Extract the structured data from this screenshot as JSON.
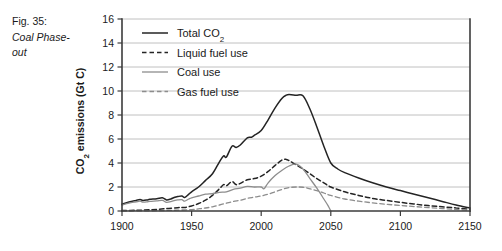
{
  "caption": {
    "label": "Fig. 35:",
    "title": "Coal Phase-out"
  },
  "chart_data": {
    "type": "line",
    "title": "",
    "xlabel": "",
    "ylabel": "CO2 emissions (Gt C)",
    "ylabel_display": "CO₂ emissions (Gt C)",
    "xlim": [
      1900,
      2150
    ],
    "ylim": [
      0,
      16
    ],
    "xticks": [
      1900,
      1950,
      2000,
      2050,
      2100,
      2150
    ],
    "xticklabels": [
      "1900",
      "1950",
      "2000",
      "2050",
      "2100",
      "2150"
    ],
    "yticks": [
      0,
      2,
      4,
      6,
      8,
      10,
      12,
      14,
      16
    ],
    "yticklabels": [
      "0",
      "2",
      "4",
      "6",
      "8",
      "10",
      "12",
      "14",
      "16"
    ],
    "grid": "horizontal",
    "legend_position": "top-left-inside",
    "series": [
      {
        "name": "Total CO2",
        "name_display": "Total CO₂",
        "color": "#242424",
        "dash": "solid",
        "width": 1.5,
        "x": [
          1900,
          1905,
          1910,
          1913,
          1915,
          1918,
          1920,
          1925,
          1929,
          1932,
          1935,
          1938,
          1940,
          1943,
          1945,
          1948,
          1950,
          1955,
          1960,
          1965,
          1970,
          1973,
          1975,
          1979,
          1982,
          1985,
          1990,
          1993,
          1995,
          2000,
          2005,
          2010,
          2015,
          2018,
          2020,
          2025,
          2030,
          2035,
          2040,
          2045,
          2050,
          2055,
          2060,
          2070,
          2080,
          2090,
          2100,
          2110,
          2120,
          2130,
          2140,
          2150
        ],
        "values": [
          0.56,
          0.75,
          0.88,
          0.95,
          0.88,
          0.92,
          0.97,
          1.02,
          1.1,
          0.92,
          1.0,
          1.15,
          1.2,
          1.25,
          1.12,
          1.4,
          1.6,
          2.0,
          2.55,
          3.1,
          4.1,
          4.6,
          4.5,
          5.4,
          5.3,
          5.5,
          6.1,
          6.15,
          6.3,
          6.7,
          7.6,
          8.6,
          9.4,
          9.65,
          9.7,
          9.65,
          9.6,
          8.5,
          7.0,
          5.4,
          4.0,
          3.5,
          3.2,
          2.75,
          2.35,
          2.0,
          1.7,
          1.4,
          1.1,
          0.8,
          0.5,
          0.25
        ]
      },
      {
        "name": "Liquid fuel use",
        "color": "#242424",
        "dash": "dashed",
        "width": 1.5,
        "x": [
          1900,
          1910,
          1920,
          1930,
          1940,
          1945,
          1950,
          1955,
          1960,
          1965,
          1970,
          1973,
          1975,
          1979,
          1982,
          1985,
          1990,
          1995,
          2000,
          2005,
          2010,
          2015,
          2018,
          2020,
          2025,
          2030,
          2035,
          2040,
          2045,
          2050,
          2060,
          2070,
          2080,
          2090,
          2100,
          2110,
          2120,
          2130,
          2140,
          2150
        ],
        "values": [
          0.04,
          0.06,
          0.1,
          0.18,
          0.28,
          0.3,
          0.42,
          0.62,
          0.9,
          1.3,
          1.85,
          2.2,
          2.1,
          2.45,
          2.2,
          2.3,
          2.6,
          2.7,
          2.9,
          3.3,
          3.8,
          4.25,
          4.3,
          4.2,
          3.85,
          3.5,
          3.1,
          2.7,
          2.35,
          2.0,
          1.6,
          1.3,
          1.05,
          0.88,
          0.72,
          0.58,
          0.45,
          0.35,
          0.25,
          0.15
        ]
      },
      {
        "name": "Coal use",
        "color": "#8d8d8d",
        "dash": "solid",
        "width": 1.3,
        "x": [
          1900,
          1905,
          1910,
          1913,
          1915,
          1918,
          1920,
          1925,
          1929,
          1932,
          1935,
          1938,
          1940,
          1943,
          1945,
          1948,
          1950,
          1955,
          1960,
          1965,
          1970,
          1975,
          1980,
          1985,
          1990,
          1995,
          2000,
          2002,
          2005,
          2010,
          2015,
          2020,
          2025,
          2030,
          2035,
          2040,
          2045,
          2048,
          2050
        ],
        "values": [
          0.5,
          0.66,
          0.76,
          0.82,
          0.74,
          0.76,
          0.8,
          0.84,
          0.88,
          0.72,
          0.78,
          0.88,
          0.92,
          0.95,
          0.82,
          1.0,
          1.1,
          1.25,
          1.4,
          1.45,
          1.55,
          1.6,
          1.8,
          1.9,
          2.05,
          2.0,
          2.0,
          1.85,
          2.35,
          2.95,
          3.4,
          3.75,
          3.9,
          3.5,
          2.7,
          1.9,
          1.0,
          0.45,
          0.0
        ]
      },
      {
        "name": "Gas fuel use",
        "color": "#8d8d8d",
        "dash": "dashed",
        "width": 1.3,
        "x": [
          1900,
          1920,
          1930,
          1940,
          1950,
          1955,
          1960,
          1965,
          1970,
          1975,
          1980,
          1985,
          1990,
          1995,
          2000,
          2005,
          2010,
          2015,
          2020,
          2025,
          2030,
          2035,
          2040,
          2045,
          2050,
          2060,
          2070,
          2080,
          2090,
          2100,
          2110,
          2120,
          2130,
          2140,
          2150
        ],
        "values": [
          0.01,
          0.02,
          0.04,
          0.07,
          0.12,
          0.18,
          0.25,
          0.35,
          0.5,
          0.65,
          0.8,
          0.9,
          1.05,
          1.15,
          1.25,
          1.4,
          1.6,
          1.8,
          1.95,
          2.0,
          1.98,
          1.85,
          1.7,
          1.5,
          1.3,
          1.0,
          0.82,
          0.68,
          0.56,
          0.46,
          0.37,
          0.29,
          0.21,
          0.13,
          0.07
        ]
      }
    ]
  }
}
